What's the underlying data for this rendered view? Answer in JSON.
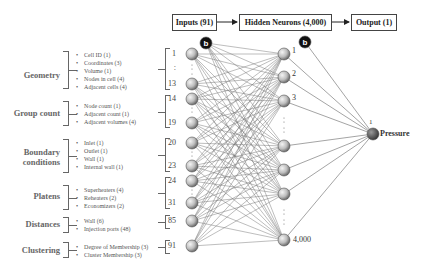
{
  "header": {
    "inputs_box": "Inputs (91)",
    "hidden_box": "Hidden Neurons (4,000)",
    "output_box": "Output (1)"
  },
  "categories": [
    {
      "name": "Geometry",
      "items": [
        "Cell ID (1)",
        "Coordinates (3)",
        "Volume (1)",
        "Nodes in cell (4)",
        "Adjacent cells (4)"
      ],
      "range": [
        "1",
        "13"
      ]
    },
    {
      "name": "Group count",
      "items": [
        "Node count (1)",
        "Adjacent count (1)",
        "Adjacent volumes (4)"
      ],
      "range": [
        "14",
        "19"
      ]
    },
    {
      "name": "Boundary conditions",
      "name_lines": [
        "Boundary",
        "conditions"
      ],
      "items": [
        "Inlet (1)",
        "Outlet (1)",
        "Wall (1)",
        "Internal wall (1)"
      ],
      "range": [
        "20",
        "23"
      ]
    },
    {
      "name": "Platens",
      "items": [
        "Superheaters (4)",
        "Reheaters (2)",
        "Economizers (2)"
      ],
      "range": [
        "24",
        "31"
      ]
    },
    {
      "name": "Distances",
      "items": [
        "Wall (6)",
        "Injection ports (48)"
      ],
      "range": [
        "85"
      ]
    },
    {
      "name": "Clustering",
      "items": [
        "Degree of Membership (3)",
        "Cluster Membership (3)"
      ],
      "range": [
        "91"
      ]
    }
  ],
  "bias_label": "b",
  "hidden_labels": [
    "1",
    "2",
    "3",
    "4,000"
  ],
  "output": {
    "index": "1",
    "label": "Pressure"
  },
  "ellipsis": ":"
}
